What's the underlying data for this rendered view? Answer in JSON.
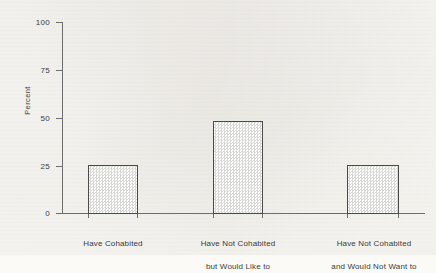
{
  "chart_data": {
    "type": "bar",
    "title": "",
    "subtitle": "",
    "xlabel": "",
    "ylabel": "Percent",
    "ylim": [
      0,
      100
    ],
    "yticks": [
      0,
      25,
      50,
      75,
      100
    ],
    "ytick_labels": [
      "0",
      "25",
      "50",
      "75",
      "100"
    ],
    "grid": false,
    "legend": null,
    "categories": [
      "Have Cohabited",
      "Have Not Cohabited\nbut Would Like to",
      "Have Not Cohabited\nand Would Not Want to"
    ],
    "values": [
      25,
      48,
      25
    ],
    "series": [
      {
        "name": "Percent",
        "values": [
          25,
          48,
          25
        ]
      }
    ],
    "bar_fill": "stipple-checker",
    "bar_edge_color": "#4a4a4a",
    "bar_fill_color": "#d8d8d4",
    "axis_color": "#6d6d6d",
    "background_color": "#fbfaf7",
    "text_color": "#3a3a3a"
  },
  "axis": {
    "y_title": "Percent",
    "ticks": [
      {
        "label": "100",
        "value": 100
      },
      {
        "label": "75",
        "value": 75
      },
      {
        "label": "50",
        "value": 50
      },
      {
        "label": "25",
        "value": 25
      },
      {
        "label": "0",
        "value": 0
      }
    ]
  },
  "categories": [
    {
      "line1": "Have Cohabited",
      "line2": "",
      "value": 25
    },
    {
      "line1": "Have Not Cohabited",
      "line2": "but Would Like to",
      "value": 48
    },
    {
      "line1": "Have Not Cohabited",
      "line2": "and Would Not Want to",
      "value": 25
    }
  ]
}
